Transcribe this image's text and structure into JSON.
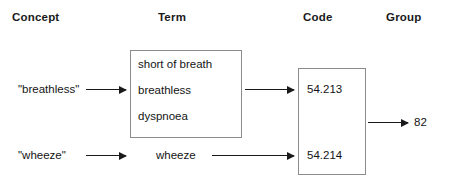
{
  "diagram": {
    "columns": [
      {
        "key": "concept",
        "label": "Concept"
      },
      {
        "key": "term",
        "label": "Term"
      },
      {
        "key": "code",
        "label": "Code"
      },
      {
        "key": "group",
        "label": "Group"
      }
    ],
    "concepts": [
      {
        "label": "\"breathless\""
      },
      {
        "label": "\"wheeze\""
      }
    ],
    "term_box": {
      "lines": [
        "short of breath",
        "breathless",
        "dyspnoea"
      ]
    },
    "term_standalone": "wheeze",
    "code_box": {
      "lines": [
        "54.213",
        "54.214"
      ]
    },
    "group": {
      "value": "82"
    },
    "colors": {
      "box_border": "#8c8c8c",
      "arrow": "#1a1a1a",
      "text": "#141414",
      "background": "#ffffff"
    },
    "arrows": [
      {
        "name": "concept-breathless-to-term-box",
        "from": "\"breathless\"",
        "to": "breathless"
      },
      {
        "name": "term-box-to-code-54213",
        "from": "breathless",
        "to": "54.213"
      },
      {
        "name": "concept-wheeze-to-term-wheeze",
        "from": "\"wheeze\"",
        "to": "wheeze"
      },
      {
        "name": "term-wheeze-to-code-54214",
        "from": "wheeze",
        "to": "54.214"
      },
      {
        "name": "code-box-to-group-82",
        "from": "code box",
        "to": "82"
      }
    ]
  }
}
